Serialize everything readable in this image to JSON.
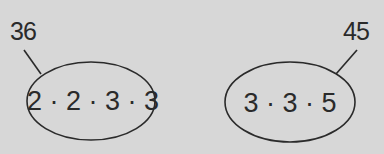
{
  "diagram": {
    "left": {
      "number": "36",
      "factorization": "2 · 2 · 3 · 3"
    },
    "right": {
      "number": "45",
      "factorization": "3 · 3 · 5"
    }
  }
}
